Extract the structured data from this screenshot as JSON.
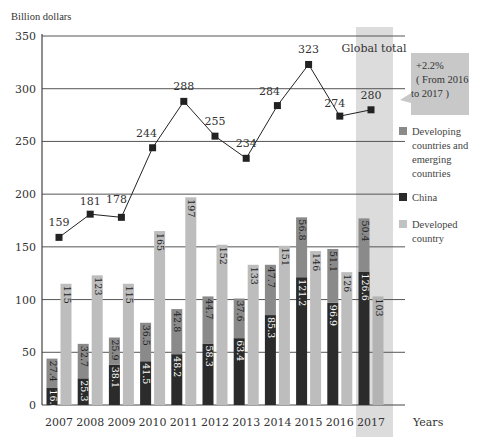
{
  "chart_data": {
    "type": "bar",
    "subtype": "stacked bar + grouped bar + line",
    "title": "",
    "ylabel": "Billion dollars",
    "xlabel": "Years",
    "ylim": [
      0,
      350
    ],
    "yticks": [
      0,
      50,
      100,
      150,
      200,
      250,
      300,
      350
    ],
    "grid": true,
    "categories": [
      "2007",
      "2008",
      "2009",
      "2010",
      "2011",
      "2012",
      "2013",
      "2014",
      "2015",
      "2016",
      "2017"
    ],
    "series": [
      {
        "name": "China",
        "kind": "stacked-bar",
        "color": "#2b2b2b",
        "values": [
          16.6,
          25.3,
          38.1,
          41.5,
          48.2,
          58.3,
          63.4,
          85.3,
          121.2,
          96.9,
          126.6
        ]
      },
      {
        "name": "Developing countries and emerging countries",
        "kind": "stacked-bar",
        "color": "#8a8a8a",
        "values": [
          27.4,
          32.7,
          25.9,
          36.5,
          42.8,
          44.7,
          37.6,
          47.7,
          56.8,
          51.1,
          50.4
        ]
      },
      {
        "name": "Developed country",
        "kind": "bar",
        "color": "#bdbdbd",
        "values": [
          115,
          123,
          115,
          165,
          197,
          152,
          133,
          151,
          146,
          126,
          103
        ]
      },
      {
        "name": "Global total",
        "kind": "line",
        "color": "#222222",
        "values": [
          159,
          181,
          178,
          244,
          288,
          255,
          234,
          284,
          323,
          274,
          280
        ]
      }
    ],
    "highlight": {
      "category": "2017",
      "label": "Global total"
    },
    "annotation": {
      "text_lines": [
        "+2.2%",
        "( From 2016",
        "to 2017 )"
      ]
    },
    "legend": [
      "Developing countries and emerging countries",
      "China",
      "Developed country"
    ],
    "legend_position": "right"
  },
  "labels": {
    "ylabel": "Billion dollars",
    "xlabel": "Years",
    "highlight": "Global total",
    "callout_1": "+2.2%",
    "callout_2": "( From 2016",
    "callout_3": "to 2017 )",
    "legend_dev_1": "Developing",
    "legend_dev_2": "countries and",
    "legend_dev_3": "emerging",
    "legend_dev_4": "countries",
    "legend_china": "China",
    "legend_developed_1": "Developed",
    "legend_developed_2": "country"
  }
}
